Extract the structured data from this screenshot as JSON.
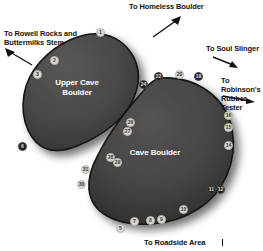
{
  "map": {
    "title": "Cave Boulder area topo map",
    "background_color": "#ffffff",
    "rock_fill_color": "#4a4846",
    "rock_outline_color": "#151413",
    "marker_light_color": "#d8d8d4",
    "marker_dark_color": "#201e1d",
    "label_color": "#ffffff",
    "caption_color": "#111111"
  },
  "captions": [
    {
      "id": "homeless",
      "text": "To Homeless Boulder"
    },
    {
      "id": "rowell",
      "text": "To Rowell Rocks and\nButtermilks Stem"
    },
    {
      "id": "soul_slinger",
      "text": "To Soul Slinger"
    },
    {
      "id": "robinsons",
      "text": "To Robinson's\nRubber Tester"
    },
    {
      "id": "roadside",
      "text": "To Roadside Area"
    }
  ],
  "boulders": [
    {
      "id": "upper_cave",
      "name": "Upper Cave\nBoulder"
    },
    {
      "id": "cave",
      "name": "Cave Boulder"
    }
  ],
  "markers": [
    {
      "n": "1",
      "style": "light"
    },
    {
      "n": "2",
      "style": "light"
    },
    {
      "n": "3",
      "style": "light"
    },
    {
      "n": "6",
      "style": "dark"
    },
    {
      "n": "24",
      "style": "dark"
    },
    {
      "n": "22",
      "style": "dark"
    },
    {
      "n": "20",
      "style": "light"
    },
    {
      "n": "19",
      "style": "dark"
    },
    {
      "n": "16",
      "style": "light"
    },
    {
      "n": "15",
      "style": "light"
    },
    {
      "n": "14",
      "style": "light"
    },
    {
      "n": "11",
      "style": "dark"
    },
    {
      "n": "12",
      "style": "dark"
    },
    {
      "n": "10",
      "style": "light"
    },
    {
      "n": "9",
      "style": "light"
    },
    {
      "n": "8",
      "style": "light"
    },
    {
      "n": "7",
      "style": "light"
    },
    {
      "n": "5",
      "style": "light"
    },
    {
      "n": "31",
      "style": "light"
    },
    {
      "n": "30",
      "style": "light"
    },
    {
      "n": "28",
      "style": "light"
    },
    {
      "n": "29",
      "style": "light"
    },
    {
      "n": "26",
      "style": "light"
    },
    {
      "n": "27",
      "style": "light"
    }
  ]
}
